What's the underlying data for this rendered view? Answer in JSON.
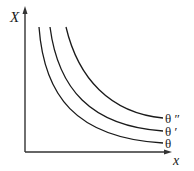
{
  "diagram": {
    "y_axis_label": "X",
    "x_axis_label": "x",
    "curves": [
      {
        "label": "θ ″",
        "id": "theta-double-prime"
      },
      {
        "label": "θ ′",
        "id": "theta-prime"
      },
      {
        "label": "θ",
        "id": "theta"
      }
    ],
    "colors": {
      "line": "#1a1a1a",
      "axis": "#333333",
      "background": "#ffffff"
    }
  }
}
